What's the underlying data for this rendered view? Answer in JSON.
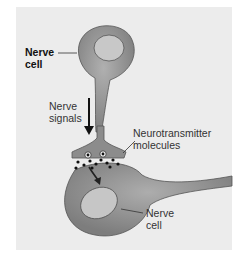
{
  "figure": {
    "labels": {
      "top_cell_line1": "Nerve",
      "top_cell_line2": "cell",
      "signals_line1": "Nerve",
      "signals_line2": "signals",
      "neuro_line1": "Neurotransmitter",
      "neuro_line2": "molecules",
      "bottom_cell_line1": "Nerve",
      "bottom_cell_line2": "cell"
    },
    "colors": {
      "background": "#ececec",
      "cell_body": "#9a9a9a",
      "nucleus": "#c9c9c9",
      "outline": "#555555"
    }
  }
}
